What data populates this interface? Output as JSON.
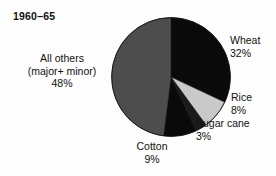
{
  "chart": {
    "title": "1960–65"
  },
  "chart_data": {
    "type": "pie",
    "title": "1960–65",
    "xlabel": "",
    "ylabel": "",
    "units": "percent",
    "legend_position": "none",
    "grid": false,
    "start_angle_deg": 0,
    "direction": "clockwise",
    "categories": [
      "Wheat",
      "Rice",
      "Sugar cane",
      "Cotton",
      "All others (major+ minor)"
    ],
    "values": [
      32,
      8,
      3,
      9,
      48
    ],
    "colors": [
      "#0a0a0a",
      "#c9c9c9",
      "#1b1b1b",
      "#0a0a0a",
      "#4d4d4d"
    ],
    "slices": [
      {
        "name": "Wheat",
        "label_line1": "Wheat",
        "label_line2": "32%",
        "value": 32,
        "color": "#0a0a0a",
        "start_deg": 0,
        "end_deg": 115.2
      },
      {
        "name": "Rice",
        "label_line1": "Rice",
        "label_line2": "8%",
        "value": 8,
        "color": "#c9c9c9",
        "start_deg": 115.2,
        "end_deg": 144.0
      },
      {
        "name": "Sugar cane",
        "label_line1": "Sugar cane",
        "label_line2": "3%",
        "value": 3,
        "color": "#1b1b1b",
        "start_deg": 144.0,
        "end_deg": 154.8
      },
      {
        "name": "Cotton",
        "label_line1": "Cotton",
        "label_line2": "9%",
        "value": 9,
        "color": "#0a0a0a",
        "start_deg": 154.8,
        "end_deg": 187.2
      },
      {
        "name": "All others (major+ minor)",
        "label_line1": "All others",
        "label_line2": "(major+ minor)",
        "label_line3": "48%",
        "value": 48,
        "color": "#4d4d4d",
        "start_deg": 187.2,
        "end_deg": 360.0
      }
    ]
  },
  "labels": {
    "all_others": {
      "line1": "All others",
      "line2": "(major+ minor)",
      "line3": "48%"
    },
    "wheat": {
      "line1": "Wheat",
      "line2": "32%"
    },
    "rice": {
      "line1": "Rice",
      "line2": "8%"
    },
    "sugar_cane": {
      "line1": "Sugar cane",
      "line2": "3%"
    },
    "cotton": {
      "line1": "Cotton",
      "line2": "9%"
    }
  }
}
